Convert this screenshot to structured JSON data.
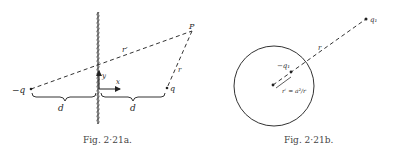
{
  "figure_a": {
    "caption": "Fig. 2·21a.",
    "labels": {
      "neg_charge": "−q",
      "charge": "q",
      "point": "P",
      "r_prime": "r′",
      "r": "r",
      "y_axis": "y",
      "x_axis": "x",
      "d_left": "d",
      "d_right": "d"
    }
  },
  "figure_b": {
    "caption": "Fig. 2·21b.",
    "labels": {
      "outer_charge": "q₁",
      "image_charge": "−q₁",
      "r": "r",
      "r_prime_eq": "r′ = a²/r"
    }
  }
}
